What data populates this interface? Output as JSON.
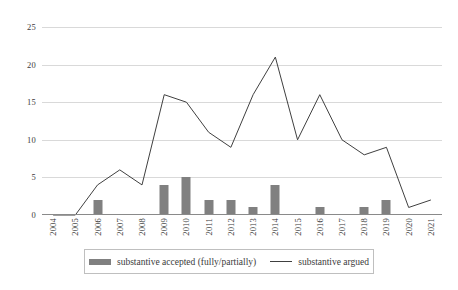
{
  "chart_data": {
    "type": "bar",
    "title": "",
    "subtitle": "",
    "xlabel": "",
    "ylabel": "",
    "categories": [
      "2004",
      "2005",
      "2006",
      "2007",
      "2008",
      "2009",
      "2010",
      "2011",
      "2012",
      "2013",
      "2014",
      "2015",
      "2016",
      "2017",
      "2018",
      "2019",
      "2020",
      "2021"
    ],
    "series": [
      {
        "name": "substantive accepted (fully/partially)",
        "type": "bar",
        "color": "#808080",
        "values": [
          0,
          0,
          2,
          0,
          0,
          4,
          5,
          2,
          2,
          1,
          4,
          0,
          1,
          0,
          1,
          2,
          0,
          0
        ]
      },
      {
        "name": "substantive argued",
        "type": "line",
        "color": "#404040",
        "values": [
          0,
          0,
          4,
          6,
          4,
          16,
          15,
          11,
          9,
          16,
          21,
          10,
          16,
          10,
          8,
          9,
          1,
          2
        ]
      }
    ],
    "ylim": [
      0,
      25
    ],
    "yticks": [
      0,
      5,
      10,
      15,
      20,
      25
    ],
    "ytick_labels": [
      "0",
      "5",
      "10",
      "15",
      "20",
      "25"
    ],
    "grid": true,
    "grid_axis": "y",
    "legend_position": "bottom"
  },
  "legend": {
    "items": [
      {
        "label": "substantive accepted (fully/partially)",
        "marker": "bar-swatch-icon"
      },
      {
        "label": "substantive argued",
        "marker": "line-swatch-icon"
      }
    ]
  }
}
